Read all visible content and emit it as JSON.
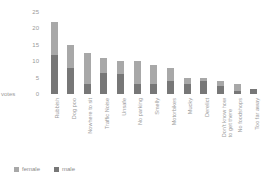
{
  "chart_data": {
    "type": "bar",
    "subtype": "stacked-bar",
    "title": "",
    "xlabel": "",
    "ylabel": "votes",
    "ylim": [
      0,
      25
    ],
    "yticks": [
      0,
      5,
      10,
      15,
      20,
      25
    ],
    "ytick_labels": [
      "0",
      "5",
      "10",
      "15",
      "20",
      "25"
    ],
    "grid": false,
    "legend_position": "bottom-left",
    "categories": [
      "Rubbish",
      "Dog poo",
      "Nowhere to sit",
      "Traffic Noise",
      "Unsafe",
      "No parking",
      "Smelly",
      "Motorbikes",
      "Mucky",
      "Derelict",
      "Don't know how\nto get there",
      "No foodshops",
      "Too far away"
    ],
    "series": [
      {
        "name": "male",
        "color": "#777777",
        "values": [
          12,
          8,
          3,
          6.5,
          6,
          3,
          3,
          4,
          3,
          4,
          2.5,
          1,
          1.5
        ]
      },
      {
        "name": "female",
        "color": "#a8a8a8",
        "values": [
          10,
          7,
          9.5,
          4.5,
          4,
          7,
          6,
          4,
          2,
          1,
          1.5,
          2,
          0
        ]
      }
    ],
    "totals": [
      22,
      15,
      12.5,
      11,
      10,
      10,
      9,
      8,
      5,
      5,
      4,
      3,
      1.5
    ]
  },
  "legend": {
    "items": [
      {
        "label": "female",
        "color": "#a8a8a8"
      },
      {
        "label": "male",
        "color": "#777777"
      }
    ]
  },
  "colors": {
    "background": "#ffffff",
    "text": "#9a9a9a",
    "female": "#a8a8a8",
    "male": "#777777"
  }
}
